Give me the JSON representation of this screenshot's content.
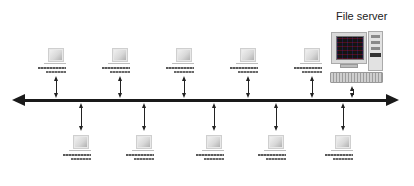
{
  "diagram": {
    "type": "bus-network-topology",
    "backbone": {
      "color": "#1a1a1a",
      "direction": "bidirectional"
    },
    "server": {
      "label": "File server",
      "icon": "desktop-server-icon"
    },
    "top_workstations": [
      {
        "id": "ws-top-1",
        "icon": "workstation-icon"
      },
      {
        "id": "ws-top-2",
        "icon": "workstation-icon"
      },
      {
        "id": "ws-top-3",
        "icon": "workstation-icon"
      },
      {
        "id": "ws-top-4",
        "icon": "workstation-icon"
      },
      {
        "id": "ws-top-5",
        "icon": "workstation-icon"
      }
    ],
    "bottom_workstations": [
      {
        "id": "ws-bottom-1",
        "icon": "workstation-icon"
      },
      {
        "id": "ws-bottom-2",
        "icon": "workstation-icon"
      },
      {
        "id": "ws-bottom-3",
        "icon": "workstation-icon"
      },
      {
        "id": "ws-bottom-4",
        "icon": "workstation-icon"
      },
      {
        "id": "ws-bottom-5",
        "icon": "workstation-icon"
      }
    ],
    "node_count": 11
  }
}
